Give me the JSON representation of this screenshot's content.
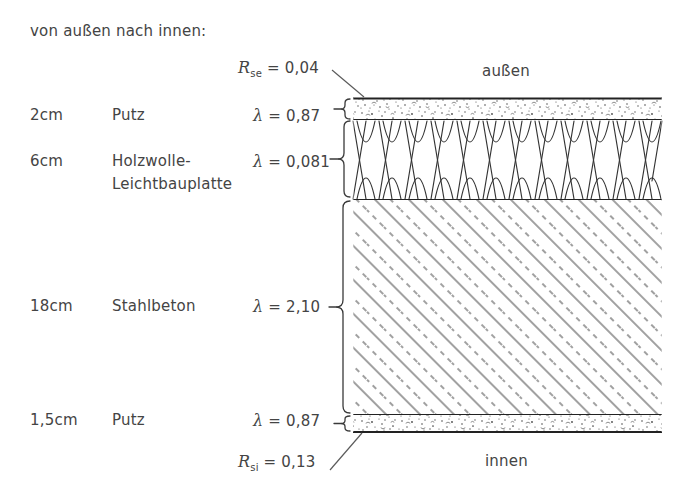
{
  "title_note": "von außen nach innen:",
  "sides": {
    "outside_label": "außen",
    "inside_label": "innen"
  },
  "surface_resistances": [
    {
      "name": "R_se",
      "symbol": "R",
      "subscript": "se",
      "equals": "=",
      "value": "0,04",
      "full": "R se = 0,04"
    },
    {
      "name": "R_si",
      "symbol": "R",
      "subscript": "si",
      "equals": "=",
      "value": "0,13",
      "full": "R si = 0,13"
    }
  ],
  "layers": [
    {
      "thickness": "2cm",
      "material": "Putz",
      "material_line2": "",
      "lambda_symbol": "λ",
      "lambda_equals": "=",
      "lambda_value": "0,87",
      "hatch": "stipple-plaster"
    },
    {
      "thickness": "6cm",
      "material": "Holzwolle-",
      "material_line2": "Leichtbauplatte",
      "lambda_symbol": "λ",
      "lambda_equals": "=",
      "lambda_value": "0,081",
      "hatch": "woodwool-lens"
    },
    {
      "thickness": "18cm",
      "material": "Stahlbeton",
      "material_line2": "",
      "lambda_symbol": "λ",
      "lambda_equals": "=",
      "lambda_value": "2,10",
      "hatch": "reinforced-concrete-diagonal"
    },
    {
      "thickness": "1,5cm",
      "material": "Putz",
      "material_line2": "",
      "lambda_symbol": "λ",
      "lambda_equals": "=",
      "lambda_value": "0,87",
      "hatch": "stipple-plaster"
    }
  ],
  "colors": {
    "ink": "#3a3a3a",
    "line": "#2b2b2b",
    "hatch": "#555555",
    "background": "#ffffff"
  }
}
